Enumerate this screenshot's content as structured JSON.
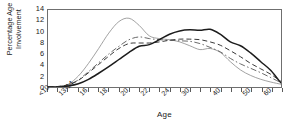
{
  "chart_data": {
    "type": "line",
    "title": "",
    "xlabel": "Age",
    "ylabel": "Percentage Age\nInvolvement",
    "ylim": [
      0,
      14
    ],
    "yticks": [
      0,
      2,
      4,
      6,
      8,
      10,
      12,
      14
    ],
    "grid": false,
    "legend": "none",
    "frame": true,
    "x_tick_labels": [
      "<10",
      "13-14",
      "16",
      "18",
      "20",
      "22",
      "24",
      "30",
      "40",
      "50",
      "60"
    ],
    "x_tick_label_positions": [
      0,
      2,
      4,
      6,
      8,
      10,
      12,
      14,
      17,
      20,
      22
    ],
    "x_tick_count": 24,
    "x": [
      0,
      1,
      2,
      3,
      4,
      5,
      6,
      7,
      8,
      9,
      10,
      11,
      12,
      13,
      14,
      15,
      16,
      17,
      18,
      19,
      20,
      21,
      22,
      23
    ],
    "series": [
      {
        "name": "series-1-thin-solid",
        "style": "solid-thin",
        "color": "#8a8a8a",
        "values": [
          0.0,
          0.1,
          0.5,
          2.0,
          4.3,
          7.0,
          9.8,
          11.9,
          12.5,
          11.2,
          9.3,
          8.8,
          8.6,
          8.2,
          7.5,
          6.8,
          7.0,
          6.3,
          4.6,
          3.1,
          2.1,
          1.4,
          0.9,
          0.5
        ]
      },
      {
        "name": "series-2-dash-dot",
        "style": "dash-dot",
        "color": "#6a6a6a",
        "values": [
          0.0,
          0.1,
          0.4,
          1.3,
          2.8,
          4.4,
          6.0,
          7.4,
          8.6,
          9.1,
          8.8,
          8.6,
          8.5,
          8.4,
          8.3,
          7.9,
          7.2,
          6.4,
          5.2,
          4.2,
          3.4,
          2.6,
          1.7,
          0.8
        ]
      },
      {
        "name": "series-3-dashed",
        "style": "dashed",
        "color": "#3a3a3a",
        "values": [
          0.0,
          0.1,
          0.4,
          1.2,
          2.6,
          4.1,
          5.6,
          7.0,
          7.9,
          8.0,
          8.0,
          8.2,
          8.5,
          8.7,
          8.7,
          8.6,
          8.2,
          7.6,
          6.6,
          5.5,
          4.3,
          3.3,
          2.3,
          1.0
        ]
      },
      {
        "name": "series-4-thick-solid",
        "style": "solid-thick",
        "color": "#1c1c1c",
        "values": [
          0.0,
          0.0,
          0.2,
          0.6,
          1.4,
          2.5,
          3.7,
          5.0,
          6.3,
          7.4,
          7.7,
          8.6,
          9.6,
          10.2,
          10.4,
          10.3,
          10.5,
          9.6,
          8.2,
          7.5,
          6.2,
          4.6,
          3.0,
          0.7
        ]
      }
    ]
  }
}
